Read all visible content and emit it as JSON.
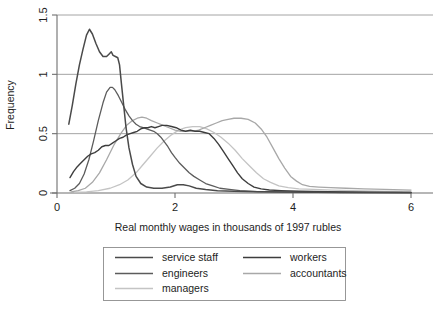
{
  "chart_data": {
    "type": "line",
    "title": "",
    "xlabel": "Real monthly wages in thousands of 1997 rubles",
    "ylabel": "Frequency",
    "xlim": [
      -0.15,
      6.2
    ],
    "ylim": [
      -0.04,
      1.55
    ],
    "xticks": [
      0,
      2,
      4,
      6
    ],
    "xtick_labels": [
      "0",
      "2",
      "4",
      "6"
    ],
    "yticks": [
      0,
      0.5,
      1,
      1.5
    ],
    "ytick_labels": [
      "0",
      "0.5",
      "1",
      "1.5"
    ],
    "grid": "horizontal",
    "legend_position": "below-center",
    "series": [
      {
        "name": "service staff",
        "color": "#4a4a4a",
        "width": 1.5,
        "points": [
          [
            0.2,
            0.58
          ],
          [
            0.26,
            0.74
          ],
          [
            0.32,
            0.92
          ],
          [
            0.38,
            1.08
          ],
          [
            0.44,
            1.21
          ],
          [
            0.5,
            1.33
          ],
          [
            0.55,
            1.38
          ],
          [
            0.6,
            1.34
          ],
          [
            0.66,
            1.26
          ],
          [
            0.72,
            1.19
          ],
          [
            0.78,
            1.15
          ],
          [
            0.84,
            1.15
          ],
          [
            0.88,
            1.17
          ],
          [
            0.92,
            1.19
          ],
          [
            0.95,
            1.16
          ],
          [
            0.99,
            1.15
          ],
          [
            1.03,
            1.14
          ],
          [
            1.06,
            1.08
          ],
          [
            1.09,
            0.93
          ],
          [
            1.13,
            0.74
          ],
          [
            1.17,
            0.55
          ],
          [
            1.22,
            0.38
          ],
          [
            1.28,
            0.24
          ],
          [
            1.34,
            0.14
          ],
          [
            1.42,
            0.08
          ],
          [
            1.52,
            0.05
          ],
          [
            1.64,
            0.04
          ],
          [
            1.78,
            0.04
          ],
          [
            1.92,
            0.05
          ],
          [
            2.04,
            0.07
          ],
          [
            2.14,
            0.07
          ],
          [
            2.24,
            0.06
          ],
          [
            2.36,
            0.04
          ],
          [
            2.52,
            0.03
          ],
          [
            2.72,
            0.02
          ],
          [
            3.0,
            0.015
          ],
          [
            3.4,
            0.01
          ],
          [
            4.0,
            0.008
          ],
          [
            4.8,
            0.005
          ],
          [
            6.0,
            0.003
          ]
        ]
      },
      {
        "name": "workers",
        "color": "#3d3d3d",
        "width": 1.4,
        "points": [
          [
            0.22,
            0.13
          ],
          [
            0.28,
            0.18
          ],
          [
            0.34,
            0.22
          ],
          [
            0.4,
            0.25
          ],
          [
            0.46,
            0.28
          ],
          [
            0.52,
            0.31
          ],
          [
            0.58,
            0.33
          ],
          [
            0.64,
            0.34
          ],
          [
            0.7,
            0.36
          ],
          [
            0.76,
            0.39
          ],
          [
            0.82,
            0.4
          ],
          [
            0.88,
            0.4
          ],
          [
            0.94,
            0.42
          ],
          [
            1.0,
            0.44
          ],
          [
            1.06,
            0.46
          ],
          [
            1.12,
            0.47
          ],
          [
            1.18,
            0.49
          ],
          [
            1.24,
            0.5
          ],
          [
            1.3,
            0.51
          ],
          [
            1.36,
            0.52
          ],
          [
            1.42,
            0.54
          ],
          [
            1.48,
            0.55
          ],
          [
            1.54,
            0.55
          ],
          [
            1.6,
            0.56
          ],
          [
            1.66,
            0.55
          ],
          [
            1.72,
            0.56
          ],
          [
            1.78,
            0.57
          ],
          [
            1.86,
            0.57
          ],
          [
            1.94,
            0.56
          ],
          [
            2.02,
            0.55
          ],
          [
            2.1,
            0.53
          ],
          [
            2.18,
            0.52
          ],
          [
            2.26,
            0.53
          ],
          [
            2.34,
            0.52
          ],
          [
            2.42,
            0.52
          ],
          [
            2.5,
            0.51
          ],
          [
            2.58,
            0.5
          ],
          [
            2.66,
            0.46
          ],
          [
            2.74,
            0.41
          ],
          [
            2.82,
            0.35
          ],
          [
            2.9,
            0.29
          ],
          [
            2.98,
            0.23
          ],
          [
            3.06,
            0.17
          ],
          [
            3.14,
            0.12
          ],
          [
            3.24,
            0.08
          ],
          [
            3.34,
            0.05
          ],
          [
            3.46,
            0.035
          ],
          [
            3.6,
            0.025
          ],
          [
            3.8,
            0.02
          ],
          [
            4.1,
            0.015
          ],
          [
            4.6,
            0.01
          ],
          [
            5.3,
            0.007
          ],
          [
            6.0,
            0.005
          ]
        ]
      },
      {
        "name": "engineers",
        "color": "#5c5c5c",
        "width": 1.3,
        "points": [
          [
            0.22,
            0.02
          ],
          [
            0.3,
            0.04
          ],
          [
            0.38,
            0.08
          ],
          [
            0.46,
            0.16
          ],
          [
            0.54,
            0.28
          ],
          [
            0.62,
            0.44
          ],
          [
            0.7,
            0.61
          ],
          [
            0.78,
            0.76
          ],
          [
            0.84,
            0.85
          ],
          [
            0.9,
            0.89
          ],
          [
            0.94,
            0.89
          ],
          [
            0.98,
            0.87
          ],
          [
            1.04,
            0.82
          ],
          [
            1.1,
            0.76
          ],
          [
            1.16,
            0.7
          ],
          [
            1.22,
            0.65
          ],
          [
            1.28,
            0.61
          ],
          [
            1.34,
            0.58
          ],
          [
            1.4,
            0.56
          ],
          [
            1.46,
            0.55
          ],
          [
            1.52,
            0.54
          ],
          [
            1.58,
            0.53
          ],
          [
            1.64,
            0.52
          ],
          [
            1.7,
            0.5
          ],
          [
            1.76,
            0.47
          ],
          [
            1.82,
            0.43
          ],
          [
            1.88,
            0.39
          ],
          [
            1.94,
            0.34
          ],
          [
            2.0,
            0.3
          ],
          [
            2.08,
            0.25
          ],
          [
            2.16,
            0.21
          ],
          [
            2.24,
            0.17
          ],
          [
            2.32,
            0.14
          ],
          [
            2.42,
            0.11
          ],
          [
            2.52,
            0.08
          ],
          [
            2.64,
            0.06
          ],
          [
            2.76,
            0.04
          ],
          [
            2.92,
            0.03
          ],
          [
            3.1,
            0.02
          ],
          [
            3.4,
            0.012
          ],
          [
            3.9,
            0.008
          ],
          [
            4.6,
            0.005
          ],
          [
            6.0,
            0.003
          ]
        ]
      },
      {
        "name": "accountants",
        "color": "#a8a8a8",
        "width": 1.3,
        "points": [
          [
            0.24,
            0.01
          ],
          [
            0.36,
            0.02
          ],
          [
            0.48,
            0.04
          ],
          [
            0.6,
            0.09
          ],
          [
            0.72,
            0.17
          ],
          [
            0.84,
            0.28
          ],
          [
            0.96,
            0.4
          ],
          [
            1.08,
            0.5
          ],
          [
            1.18,
            0.57
          ],
          [
            1.28,
            0.61
          ],
          [
            1.36,
            0.63
          ],
          [
            1.44,
            0.64
          ],
          [
            1.52,
            0.63
          ],
          [
            1.6,
            0.61
          ],
          [
            1.7,
            0.59
          ],
          [
            1.8,
            0.57
          ],
          [
            1.9,
            0.55
          ],
          [
            2.0,
            0.53
          ],
          [
            2.1,
            0.52
          ],
          [
            2.2,
            0.52
          ],
          [
            2.3,
            0.52
          ],
          [
            2.4,
            0.53
          ],
          [
            2.5,
            0.55
          ],
          [
            2.6,
            0.57
          ],
          [
            2.7,
            0.59
          ],
          [
            2.8,
            0.61
          ],
          [
            2.9,
            0.62
          ],
          [
            3.0,
            0.63
          ],
          [
            3.12,
            0.63
          ],
          [
            3.24,
            0.62
          ],
          [
            3.36,
            0.59
          ],
          [
            3.46,
            0.54
          ],
          [
            3.56,
            0.47
          ],
          [
            3.66,
            0.38
          ],
          [
            3.76,
            0.29
          ],
          [
            3.86,
            0.21
          ],
          [
            3.96,
            0.14
          ],
          [
            4.06,
            0.1
          ],
          [
            4.16,
            0.07
          ],
          [
            4.28,
            0.055
          ],
          [
            4.44,
            0.05
          ],
          [
            4.64,
            0.045
          ],
          [
            4.9,
            0.04
          ],
          [
            5.2,
            0.035
          ],
          [
            5.55,
            0.03
          ],
          [
            6.0,
            0.025
          ]
        ]
      },
      {
        "name": "managers",
        "color": "#c4c4c4",
        "width": 1.3,
        "points": [
          [
            0.3,
            0.005
          ],
          [
            0.5,
            0.01
          ],
          [
            0.7,
            0.02
          ],
          [
            0.9,
            0.04
          ],
          [
            1.06,
            0.07
          ],
          [
            1.2,
            0.11
          ],
          [
            1.34,
            0.17
          ],
          [
            1.46,
            0.24
          ],
          [
            1.58,
            0.31
          ],
          [
            1.7,
            0.38
          ],
          [
            1.82,
            0.44
          ],
          [
            1.94,
            0.49
          ],
          [
            2.06,
            0.53
          ],
          [
            2.18,
            0.55
          ],
          [
            2.3,
            0.56
          ],
          [
            2.42,
            0.56
          ],
          [
            2.54,
            0.54
          ],
          [
            2.66,
            0.51
          ],
          [
            2.78,
            0.47
          ],
          [
            2.9,
            0.42
          ],
          [
            3.02,
            0.36
          ],
          [
            3.14,
            0.29
          ],
          [
            3.26,
            0.23
          ],
          [
            3.38,
            0.17
          ],
          [
            3.5,
            0.12
          ],
          [
            3.62,
            0.09
          ],
          [
            3.76,
            0.06
          ],
          [
            3.92,
            0.045
          ],
          [
            4.1,
            0.035
          ],
          [
            4.35,
            0.03
          ],
          [
            4.65,
            0.025
          ],
          [
            5.0,
            0.02
          ],
          [
            5.45,
            0.015
          ],
          [
            6.0,
            0.012
          ]
        ]
      }
    ]
  },
  "legend": {
    "entries": [
      {
        "label": "service staff",
        "color": "#4a4a4a"
      },
      {
        "label": "workers",
        "color": "#3d3d3d"
      },
      {
        "label": "engineers",
        "color": "#5c5c5c"
      },
      {
        "label": "accountants",
        "color": "#a8a8a8"
      },
      {
        "label": "managers",
        "color": "#c4c4c4"
      }
    ]
  }
}
